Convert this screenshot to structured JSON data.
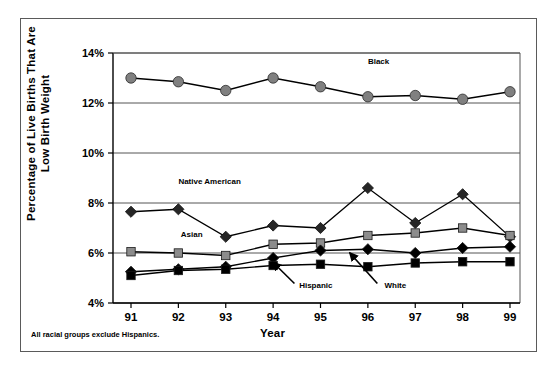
{
  "figure": {
    "footnote": "All racial groups exclude Hispanics.",
    "frame_color": "#5a5a5a"
  },
  "chart_data": {
    "type": "line",
    "title": "",
    "subtitle": "",
    "xlabel": "Year",
    "ylabel": "Percentage of Live Births That Are\nLow Birth Weight",
    "categories": [
      "91",
      "92",
      "93",
      "94",
      "95",
      "96",
      "97",
      "98",
      "99"
    ],
    "x": [
      1991,
      1992,
      1993,
      1994,
      1995,
      1996,
      1997,
      1998,
      1999
    ],
    "ylim": [
      4,
      14
    ],
    "yticks": [
      4,
      6,
      8,
      10,
      12,
      14
    ],
    "ytick_labels": [
      "4%",
      "6%",
      "8%",
      "10%",
      "12%",
      "14%"
    ],
    "grid": true,
    "grid_axis": "y",
    "legend": "inline-annotations",
    "series": [
      {
        "name": "Black",
        "label": "Black",
        "label_x": 1996.0,
        "label_y": 13.55,
        "marker": "circle",
        "color": "#808080",
        "line_color": "#000000",
        "values": [
          13.0,
          12.85,
          12.5,
          13.0,
          12.65,
          12.25,
          12.3,
          12.15,
          12.45
        ]
      },
      {
        "name": "Native American",
        "label": "Native American",
        "label_x": 1992.0,
        "label_y": 8.75,
        "marker": "diamond",
        "color": "#262626",
        "line_color": "#000000",
        "values": [
          7.65,
          7.75,
          6.65,
          7.1,
          7.0,
          8.6,
          7.2,
          8.35,
          6.65
        ]
      },
      {
        "name": "Asian",
        "label": "Asian",
        "label_x": 1992.05,
        "label_y": 6.65,
        "marker": "square",
        "color": "#8c8c8c",
        "line_color": "#000000",
        "values": [
          6.05,
          6.0,
          5.9,
          6.35,
          6.4,
          6.7,
          6.8,
          7.0,
          6.7
        ]
      },
      {
        "name": "Hispanic",
        "label": "Hispanic",
        "label_x": 1994.55,
        "label_y": 4.62,
        "marker": "diamond",
        "color": "#000000",
        "line_color": "#000000",
        "values": [
          5.25,
          5.35,
          5.45,
          5.8,
          6.1,
          6.15,
          6.0,
          6.2,
          6.25
        ]
      },
      {
        "name": "White",
        "label": "White",
        "label_x": 1996.35,
        "label_y": 4.62,
        "marker": "square",
        "color": "#000000",
        "line_color": "#000000",
        "values": [
          5.1,
          5.3,
          5.35,
          5.5,
          5.55,
          5.45,
          5.6,
          5.65,
          5.65
        ]
      }
    ],
    "annotations": [
      {
        "name": "hispanic-arrow",
        "from_x": 1994.45,
        "from_y": 4.78,
        "to_x": 1994.0,
        "to_y": 5.62
      },
      {
        "name": "white-arrow",
        "from_x": 1996.2,
        "from_y": 4.78,
        "to_x": 1995.62,
        "to_y": 6.0
      }
    ]
  }
}
